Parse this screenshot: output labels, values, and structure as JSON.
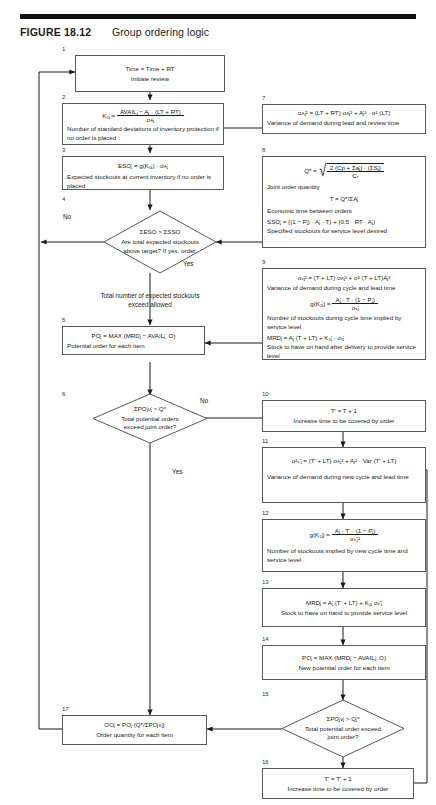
{
  "figure": {
    "label": "FIGURE 18.12",
    "title": "Group ordering logic"
  },
  "colors": {
    "rule": "#111111",
    "box_border": "#58585a",
    "line": "#1a1a1a",
    "text": "#1a1a1a"
  },
  "nodes": {
    "n1": {
      "number": "1",
      "eq": "Time = Time + RT",
      "caption": "Initiate review"
    },
    "n2": {
      "number": "2",
      "eq_lhs": "K₀ⱼ  =",
      "eq_num": "AVAILⱼ − Aⱼ · (LT + RT)",
      "eq_den": "σᴀⱼ",
      "caption": "Number of standard deviations of inventory protection if no order is placed"
    },
    "n3": {
      "number": "3",
      "eq": "ESOⱼ = g(K₀ⱼ) · σᴀⱼ",
      "caption": "Expected stockouts at current inventory if no order is placed"
    },
    "n4": {
      "number": "4",
      "eq": "ΣESO > ΣSSO",
      "caption": "Are total expected stockouts above target? If yes, order.",
      "branch_no": "No",
      "branch_yes": "Yes"
    },
    "n4_note": "Total number of expected stockouts exceed allowed",
    "n5": {
      "number": "5",
      "eq": "POⱼ = MAX (MRDⱼ − AVAILⱼ, O)",
      "caption": "Potential order for each item"
    },
    "n6": {
      "number": "6",
      "eq": "ΣPOⱼνⱼ > Q*",
      "caption": "Total potential orders exceed joint order?",
      "branch_no": "No",
      "branch_yes": "Yes"
    },
    "n7": {
      "number": "7",
      "eq": "σᴀⱼ² = (LT + RT) σᴀⱼ² + Aⱼ² · σ² (LT)",
      "caption": "Variance of demand during lead and review time"
    },
    "n8": {
      "number": "8",
      "eq_lhs": "Q*  =",
      "eq_num": "2 (Cp + Σaⱼ) · (ΣSⱼ)",
      "eq_den": "Cᵣ",
      "caption1": "Joint order quantity",
      "eq2": "T = Q*/ΣAⱼ",
      "caption2": "Economic time between orders",
      "eq3": "SSOⱼ = ((1 − Pⱼ) · Aⱼ · T) + (0.5 · RT · Aⱼ)",
      "caption3": "Specified stockouts for service level desired"
    },
    "n9": {
      "number": "9",
      "eq1": "σₓⱼ² = (T + LT) σᴀⱼ² + σ² (T + LT)Aⱼ²",
      "caption1": "Variance of demand during cycle and lead time",
      "eq2_lhs": "g(K₂ⱼ)  =",
      "eq2_num": "Aⱼ · T · (1 − Pⱼ)",
      "eq2_den": "σₓⱼ",
      "caption2": "Number of stockouts during cycle time implied by service level",
      "eq3": "MRDⱼ = Aⱼ (T + LT) + K₂ⱼ · σₓⱼ",
      "caption3": "Stock to have on hand after delivery to provide service level"
    },
    "n10": {
      "number": "10",
      "eq": "T' = T + 1",
      "caption": "Increase time to be covered by order"
    },
    "n11": {
      "number": "11",
      "eq": "σ²ₓ'ⱼ = (T' + LT) σᴀⱼ² + Aⱼ² · Var (T' + LT)",
      "caption": "Variance of demand during new cycle and lead time"
    },
    "n12": {
      "number": "12",
      "eq_lhs": "g(K₂ⱼ)  =",
      "eq_num": "Aⱼ · T' · (1 − Pⱼ)",
      "eq_den": "σₓ'ⱼ²",
      "caption": "Number of stockouts implied by new cycle time and service level"
    },
    "n13": {
      "number": "13",
      "eq": "MRDⱼ = Aⱼ (T' + LT) + K₂ⱼ σₓ'ⱼ",
      "caption": "Stock to have on hand to provide service level"
    },
    "n14": {
      "number": "14",
      "eq": "POⱼ = MAX (MRDⱼ − AVAILⱼ, O)",
      "caption": "New potential order for each item"
    },
    "n15": {
      "number": "15",
      "eq": "ΣPOⱼνⱼ > Qⱼ*",
      "caption": "Total potential order exceed joint order?"
    },
    "n16": {
      "number": "16",
      "eq": "T' = T' + 1",
      "caption": "Increase time to be covered by order"
    },
    "n17": {
      "number": "17",
      "eq": "OOⱼ = POⱼ (Q*/ΣPOⱼνⱼ)",
      "caption": "Order quantity for each item"
    }
  }
}
